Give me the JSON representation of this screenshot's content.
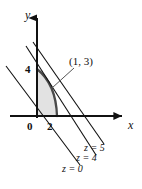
{
  "figure": {
    "background_color": "#ffffff",
    "stroke_color": "#111111",
    "region_fill_color": "#e2e2e2",
    "region_edge_color": "#4a4a4a"
  },
  "axes": {
    "x_axis": {
      "label": "x",
      "origin_px": {
        "x": 37,
        "y": 116
      },
      "end_px": {
        "x": 128,
        "y": 116
      },
      "arrow": "right"
    },
    "y_axis": {
      "label": "y",
      "origin_px": {
        "x": 37,
        "y": 116
      },
      "end_px": {
        "x": 37,
        "y": 13
      },
      "arrow": "up"
    }
  },
  "ticks": [
    {
      "label": "0",
      "axis": "origin",
      "value": 0,
      "px": {
        "x": 30,
        "y": 127
      }
    },
    {
      "label": "2",
      "axis": "x",
      "value": 2,
      "px": {
        "x": 50,
        "y": 127
      }
    },
    {
      "label": "4",
      "axis": "y",
      "value": 4,
      "px": {
        "x": 28,
        "y": 70
      }
    }
  ],
  "annotations": [
    {
      "name": "vertex-label",
      "text": "(1, 3)",
      "px": {
        "x": 69,
        "y": 62
      },
      "leader_from_px": {
        "x": 74,
        "y": 68
      },
      "leader_to_px": {
        "x": 52,
        "y": 88
      }
    }
  ],
  "level_lines": [
    {
      "name": "z-equals-0",
      "label": "z = 0",
      "value": 0,
      "label_px": {
        "x": 64,
        "y": 170
      },
      "start_px": {
        "x": 6,
        "y": 66
      },
      "end_px": {
        "x": 80,
        "y": 165
      }
    },
    {
      "name": "z-equals-4",
      "label": "z = 4",
      "value": 4,
      "label_px": {
        "x": 78,
        "y": 160
      },
      "start_px": {
        "x": 26,
        "y": 46
      },
      "end_px": {
        "x": 96,
        "y": 155
      }
    },
    {
      "name": "z-equals-5",
      "label": "z = 5",
      "value": 5,
      "label_px": {
        "x": 84,
        "y": 148
      },
      "start_px": {
        "x": 33,
        "y": 42
      },
      "end_px": {
        "x": 104,
        "y": 144
      }
    }
  ],
  "feasible_region": {
    "name": "shaded-feasible-region",
    "fill": "#e2e2e2",
    "description": "Region bounded left by the y-axis, below by the x-axis, and on the right by a concave curve from (0, 4) to (2, 0)",
    "vertices_px": [
      {
        "x": 37,
        "y": 116
      },
      {
        "x": 37,
        "y": 69
      },
      {
        "x": 57,
        "y": 116
      }
    ],
    "curve_control_px": {
      "x": 56,
      "y": 84
    }
  }
}
